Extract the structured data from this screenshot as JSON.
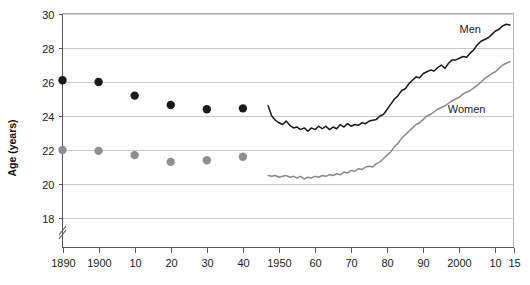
{
  "chart_data": {
    "type": "line",
    "title": "",
    "subtitle": "",
    "xlabel": "",
    "ylabel": "Age (years)",
    "ylim": [
      17,
      30
    ],
    "xlim": [
      1890,
      2015
    ],
    "grid": true,
    "y_ticks": [
      18,
      20,
      22,
      24,
      26,
      28,
      30
    ],
    "y_tick_labels": [
      "18",
      "20",
      "22",
      "24",
      "26",
      "28",
      "30"
    ],
    "y_axis_break": true,
    "x_ticks": [
      1890,
      1900,
      1910,
      1920,
      1930,
      1940,
      1950,
      1960,
      1970,
      1980,
      1990,
      2000,
      2010,
      2015
    ],
    "x_tick_labels": [
      "1890",
      "1900",
      "10",
      "20",
      "30",
      "40",
      "1950",
      "60",
      "70",
      "80",
      "90",
      "2000",
      "10",
      "15"
    ],
    "legend_position": "inline-annotation",
    "colors": {
      "men": "#1a1a1a",
      "women": "#8a8a8a",
      "grid": "#c9c9c9",
      "axis": "#555555",
      "frame": "#b5b5b5"
    },
    "annotations": [
      {
        "name": "men-label",
        "text": "Men",
        "x": 2003,
        "y": 28.9
      },
      {
        "name": "women-label",
        "text": "Women",
        "x": 2002,
        "y": 24.2
      }
    ],
    "series": [
      {
        "name": "Men",
        "color": "#1a1a1a",
        "marker_points": {
          "x": [
            1890,
            1900,
            1910,
            1920,
            1930,
            1940
          ],
          "y": [
            26.1,
            26.0,
            25.2,
            24.65,
            24.4,
            24.45
          ]
        },
        "line_x": [
          1947,
          1948,
          1949,
          1950,
          1951,
          1952,
          1953,
          1954,
          1955,
          1956,
          1957,
          1958,
          1959,
          1960,
          1961,
          1962,
          1963,
          1964,
          1965,
          1966,
          1967,
          1968,
          1969,
          1970,
          1971,
          1972,
          1973,
          1974,
          1975,
          1976,
          1977,
          1978,
          1979,
          1980,
          1981,
          1982,
          1983,
          1984,
          1985,
          1986,
          1987,
          1988,
          1989,
          1990,
          1991,
          1992,
          1993,
          1994,
          1995,
          1996,
          1997,
          1998,
          1999,
          2000,
          2001,
          2002,
          2003,
          2004,
          2005,
          2006,
          2007,
          2008,
          2009,
          2010,
          2011,
          2012,
          2013,
          2014
        ],
        "line_y": [
          24.6,
          24.0,
          23.75,
          23.6,
          23.5,
          23.7,
          23.45,
          23.3,
          23.35,
          23.2,
          23.3,
          23.1,
          23.3,
          23.2,
          23.4,
          23.25,
          23.4,
          23.2,
          23.35,
          23.25,
          23.5,
          23.35,
          23.55,
          23.4,
          23.5,
          23.45,
          23.6,
          23.55,
          23.7,
          23.75,
          23.8,
          24.0,
          24.1,
          24.4,
          24.7,
          25.0,
          25.2,
          25.5,
          25.6,
          25.9,
          26.1,
          26.3,
          26.25,
          26.5,
          26.6,
          26.7,
          26.65,
          26.85,
          27.0,
          26.8,
          27.1,
          27.3,
          27.3,
          27.4,
          27.5,
          27.45,
          27.7,
          27.9,
          28.2,
          28.4,
          28.5,
          28.6,
          28.8,
          29.0,
          29.1,
          29.3,
          29.4,
          29.35
        ],
        "line_start_year": 1947,
        "line_end_year": 2014,
        "line_end_value": 29.35
      },
      {
        "name": "Women",
        "color": "#8a8a8a",
        "marker_points": {
          "x": [
            1890,
            1900,
            1910,
            1920,
            1930,
            1940
          ],
          "y": [
            22.0,
            21.95,
            21.7,
            21.3,
            21.4,
            21.6
          ]
        },
        "line_x": [
          1947,
          1948,
          1949,
          1950,
          1951,
          1952,
          1953,
          1954,
          1955,
          1956,
          1957,
          1958,
          1959,
          1960,
          1961,
          1962,
          1963,
          1964,
          1965,
          1966,
          1967,
          1968,
          1969,
          1970,
          1971,
          1972,
          1973,
          1974,
          1975,
          1976,
          1977,
          1978,
          1979,
          1980,
          1981,
          1982,
          1983,
          1984,
          1985,
          1986,
          1987,
          1988,
          1989,
          1990,
          1991,
          1992,
          1993,
          1994,
          1995,
          1996,
          1997,
          1998,
          1999,
          2000,
          2001,
          2002,
          2003,
          2004,
          2005,
          2006,
          2007,
          2008,
          2009,
          2010,
          2011,
          2012,
          2013,
          2014
        ],
        "line_y": [
          20.5,
          20.45,
          20.5,
          20.4,
          20.45,
          20.5,
          20.4,
          20.45,
          20.35,
          20.45,
          20.3,
          20.4,
          20.35,
          20.45,
          20.4,
          20.5,
          20.45,
          20.55,
          20.5,
          20.6,
          20.55,
          20.7,
          20.65,
          20.8,
          20.75,
          20.9,
          20.85,
          21.0,
          21.05,
          21.0,
          21.2,
          21.3,
          21.5,
          21.7,
          21.9,
          22.2,
          22.4,
          22.7,
          22.9,
          23.1,
          23.3,
          23.5,
          23.6,
          23.8,
          24.0,
          24.1,
          24.25,
          24.4,
          24.5,
          24.6,
          24.75,
          24.9,
          25.0,
          25.1,
          25.3,
          25.4,
          25.5,
          25.65,
          25.8,
          26.0,
          26.2,
          26.35,
          26.5,
          26.6,
          26.8,
          27.0,
          27.1,
          27.2
        ],
        "line_start_year": 1947,
        "line_end_year": 2014,
        "line_end_value": 27.2
      }
    ]
  }
}
